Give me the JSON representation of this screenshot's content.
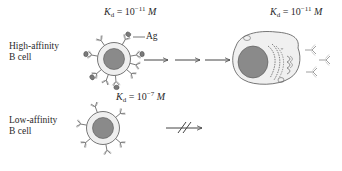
{
  "diagram": {
    "title": "",
    "rows": [
      {
        "id": "high",
        "label_line1": "High-affinity",
        "label_line2": "B cell",
        "kd_prefix": "K",
        "kd_sub": "d",
        "kd_eq": " = 10",
        "kd_exp": "−11",
        "kd_unit": " M",
        "antigen_label": "Ag",
        "outcome": "activation → plasma cell secreting antibody",
        "plasma_kd_prefix": "K",
        "plasma_kd_sub": "d",
        "plasma_kd_eq": " = 10",
        "plasma_kd_exp": "−11",
        "plasma_kd_unit": " M"
      },
      {
        "id": "low",
        "label_line1": "Low-affinity",
        "label_line2": "B cell",
        "kd_prefix": "K",
        "kd_sub": "d",
        "kd_eq": " = 10",
        "kd_exp": "−7",
        "kd_unit": " M",
        "outcome": "blocked (no activation)"
      }
    ],
    "colors": {
      "line": "#555555",
      "nucleus": "#8a8a8a",
      "cell_fill": "#ececec",
      "ag_fill": "#7a7a7a"
    },
    "icons": [
      "b-cell",
      "antigen",
      "antibody",
      "plasma-cell",
      "arrow",
      "blocked-arrow"
    ]
  }
}
